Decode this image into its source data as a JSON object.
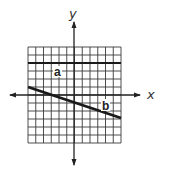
{
  "diagram": {
    "type": "coordinate-grid",
    "axes": {
      "x_label": "x",
      "y_label": "y"
    },
    "grid": {
      "columns": 12,
      "rows": 12,
      "x_range": [
        -6,
        6
      ],
      "y_range": [
        -6,
        6
      ]
    },
    "lines": [
      {
        "label": "a",
        "kind": "horizontal",
        "from": [
          -6,
          4
        ],
        "to": [
          6,
          4
        ]
      },
      {
        "label": "b",
        "kind": "slanted",
        "from": [
          -6,
          1
        ],
        "to": [
          6,
          -3
        ]
      }
    ],
    "colors": {
      "grid": "#3a3a3a",
      "lines": "#1a1a1a",
      "background": "#ffffff"
    }
  }
}
